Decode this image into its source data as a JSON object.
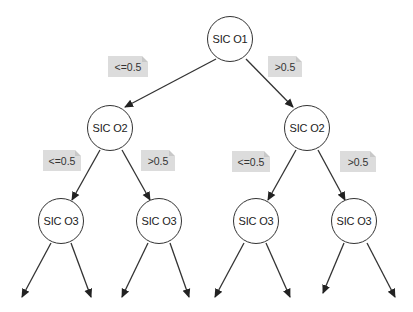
{
  "diagram": {
    "type": "decision-tree",
    "nodes": {
      "root": {
        "label": "SIC O1"
      },
      "l2_left": {
        "label": "SIC O2"
      },
      "l2_right": {
        "label": "SIC O2"
      },
      "l3_1": {
        "label": "SIC O3"
      },
      "l3_2": {
        "label": "SIC O3"
      },
      "l3_3": {
        "label": "SIC O3"
      },
      "l3_4": {
        "label": "SIC O3"
      }
    },
    "edges": {
      "root_left": {
        "label": "<=0.5"
      },
      "root_right": {
        "label": ">0.5"
      },
      "l2l_left": {
        "label": "<=0.5"
      },
      "l2l_right": {
        "label": ">0.5"
      },
      "l2r_left": {
        "label": "<=0.5"
      },
      "l2r_right": {
        "label": ">0.5"
      }
    },
    "colors": {
      "stroke": "#333333",
      "label_bg": "#dcdcdc",
      "background": "#ffffff"
    }
  }
}
